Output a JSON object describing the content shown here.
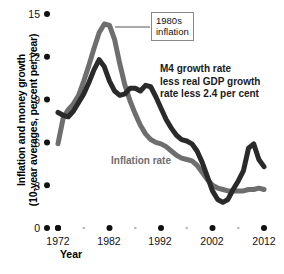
{
  "chart_data": {
    "type": "line",
    "title": "",
    "xlabel": "Year",
    "ylabel": "Inflation and money growth (10-year averages, percent per year)",
    "ylabel_line1": "Inflation and money growth",
    "ylabel_line2": "(10-year averages, percent per year)",
    "xlim": [
      1971,
      2014
    ],
    "ylim": [
      0,
      15
    ],
    "grid": false,
    "legend_position": "inline-annotations",
    "yticks": [
      15,
      12,
      9,
      6,
      3,
      0
    ],
    "ytick_labels": [
      "15",
      "12",
      "9",
      "6",
      "3",
      "0"
    ],
    "xticks": [
      1972,
      1982,
      1992,
      2002,
      2012
    ],
    "xtick_labels": [
      "1972",
      "1982",
      "1992",
      "2002",
      "2012"
    ],
    "xminor_ticks": [
      1977,
      1987,
      1997,
      2007
    ],
    "series": [
      {
        "name": "Inflation rate",
        "color": "#6e6e6e",
        "label_text": "Inflation rate",
        "x": [
          1972,
          1973,
          1974,
          1975,
          1976,
          1977,
          1978,
          1979,
          1980,
          1981,
          1982,
          1983,
          1984,
          1985,
          1986,
          1987,
          1988,
          1989,
          1990,
          1991,
          1992,
          1993,
          1994,
          1995,
          1996,
          1997,
          1998,
          1999,
          2000,
          2001,
          2002,
          2003,
          2004,
          2005,
          2006,
          2007,
          2008,
          2009,
          2010,
          2011,
          2012
        ],
        "values": [
          5.9,
          7.7,
          8.3,
          8.7,
          9.3,
          10.3,
          11.4,
          12.6,
          13.7,
          14.3,
          14.2,
          13.2,
          11.5,
          10.0,
          8.9,
          8.0,
          7.2,
          6.6,
          6.2,
          6.0,
          5.9,
          5.7,
          5.4,
          5.1,
          4.9,
          4.8,
          4.7,
          4.4,
          3.9,
          3.4,
          3.0,
          2.8,
          2.7,
          2.6,
          2.6,
          2.6,
          2.6,
          2.7,
          2.7,
          2.8,
          2.7
        ]
      },
      {
        "name": "M4 growth rate less real GDP growth rate less 2.4 per cent",
        "color": "#2a2a2a",
        "label_text": "M4 growth rate less real GDP growth rate less 2.4 per cent",
        "x": [
          1972,
          1973,
          1974,
          1975,
          1976,
          1977,
          1978,
          1979,
          1980,
          1981,
          1982,
          1983,
          1984,
          1985,
          1986,
          1987,
          1988,
          1989,
          1990,
          1991,
          1992,
          1993,
          1994,
          1995,
          1996,
          1997,
          1998,
          1999,
          2000,
          2001,
          2002,
          2003,
          2004,
          2005,
          2006,
          2007,
          2008,
          2009,
          2010,
          2011,
          2012
        ],
        "values": [
          8.1,
          7.9,
          7.8,
          8.2,
          8.8,
          9.4,
          10.2,
          11.1,
          11.8,
          11.3,
          10.3,
          9.6,
          9.3,
          9.4,
          9.8,
          9.8,
          9.6,
          10.0,
          9.9,
          9.2,
          8.4,
          7.6,
          7.0,
          6.5,
          6.2,
          6.1,
          5.9,
          5.4,
          4.6,
          3.6,
          2.6,
          2.0,
          1.8,
          2.0,
          2.7,
          3.3,
          4.0,
          5.6,
          5.9,
          4.8,
          4.3
        ]
      }
    ],
    "annotations": [
      {
        "name": "1980s-inflation-callout",
        "line1": "1980s",
        "line2": "inflation",
        "target_x": 1981,
        "target_y": 14.3
      },
      {
        "name": "m4-annotation",
        "line1": "M4 growth rate",
        "line2": "less real GDP growth",
        "line3": "rate less 2.4 per cent"
      }
    ]
  }
}
